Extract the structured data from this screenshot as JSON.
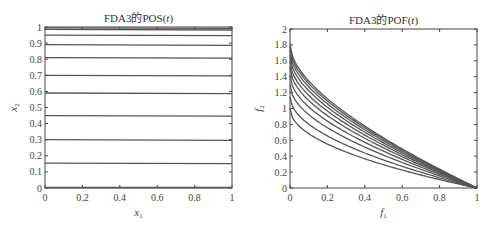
{
  "chart_data": [
    {
      "type": "line",
      "title": "FDA3的POS(t)",
      "xlabel": "x1",
      "ylabel": "x2",
      "xlim": [
        0,
        1
      ],
      "ylim": [
        0,
        1
      ],
      "xticks": [
        "0",
        "0.2",
        "0.4",
        "0.6",
        "0.8",
        "1"
      ],
      "yticks": [
        "0",
        "0.1",
        "0.2",
        "0.3",
        "0.4",
        "0.5",
        "0.6",
        "0.7",
        "0.8",
        "0.9",
        "1"
      ],
      "grid": false,
      "series_description": "Horizontal lines x2 = constant for different t",
      "levels": [
        0.155,
        0.3,
        0.45,
        0.59,
        0.7,
        0.81,
        0.89,
        0.95,
        0.985,
        0.995
      ]
    },
    {
      "type": "line",
      "title": "FDA3的POF(t)",
      "xlabel": "f1",
      "ylabel": "f2",
      "xlim": [
        0,
        1
      ],
      "ylim": [
        0,
        2
      ],
      "xticks": [
        "0",
        "0.2",
        "0.4",
        "0.6",
        "0.8",
        "1"
      ],
      "yticks": [
        "0",
        "0.2",
        "0.4",
        "0.6",
        "0.8",
        "1",
        "1.2",
        "1.4",
        "1.6",
        "1.8",
        "2"
      ],
      "grid": false,
      "series_description": "Convex fronts f2 = (1+G)(1 - sqrt(f1/(1+G)) )-like curves, starting at f2(0)=1+G and ending at f2(1)=0",
      "start_values": [
        1.0,
        1.15,
        1.3,
        1.42,
        1.52,
        1.6,
        1.67,
        1.73,
        1.78,
        1.82
      ]
    }
  ],
  "labels": {
    "left_title": "FDA3的POS(t)",
    "right_title": "FDA3的POF(t)",
    "left_xlabel": "x",
    "left_xlabel_sub": "1",
    "left_ylabel": "x",
    "left_ylabel_sub": "2",
    "right_xlabel": "f",
    "right_xlabel_sub": "1",
    "right_ylabel": "f",
    "right_ylabel_sub": "2"
  },
  "colors": {
    "line": "#555555",
    "axis": "#444444"
  }
}
